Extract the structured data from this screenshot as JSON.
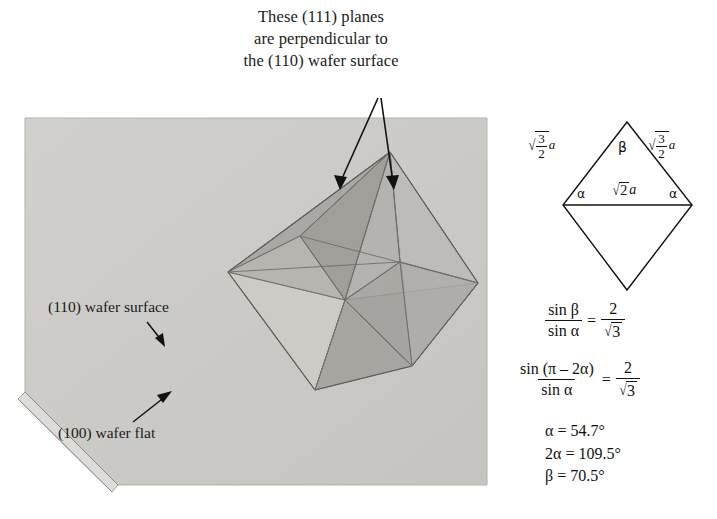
{
  "figure": {
    "kind": "crystallography-diagram",
    "caption_lines": [
      "These (111) planes",
      "are perpendicular to",
      "the (110) wafer surface"
    ],
    "caption_full": "These (111) planes are perpendicular to the (110) wafer surface"
  },
  "wafer": {
    "surface_label": "(110) wafer surface",
    "flat_label": "(100) wafer flat",
    "slab_fill": "#cccac6",
    "bevel_fill": "#dedcd8",
    "edge_stroke": "#8d8a86"
  },
  "octahedron": {
    "name": "octahedron-111-planes",
    "face_light": "#c3c1bd",
    "face_mid": "#adaba7",
    "face_dark": "#9d9b97",
    "edge_stroke": "#6f6d6a"
  },
  "arrows": {
    "count": 2,
    "color": "#111111",
    "targets": [
      "left-111-plane",
      "right-111-plane"
    ]
  },
  "rhombus": {
    "name": "rhombus-geometry",
    "stroke": "#111111",
    "edge_label_left": {
      "radical_num": "3",
      "radical_den": "2",
      "var": "a"
    },
    "edge_label_right": {
      "radical_num": "3",
      "radical_den": "2",
      "var": "a"
    },
    "diagonal_label": {
      "radical": "2",
      "var": "a"
    },
    "angle_top": "β",
    "angle_left": "α",
    "angle_right": "α"
  },
  "equations": {
    "eq1": {
      "num": "sin β",
      "den": "sin α",
      "equals": "=",
      "rhs_num": "2",
      "rhs_den_radical": "3"
    },
    "eq2": {
      "num": "sin (π – 2α)",
      "den": "sin α",
      "equals": "=",
      "rhs_num": "2",
      "rhs_den_radical": "3"
    }
  },
  "values": [
    "α = 54.7°",
    "2α = 109.5°",
    "β = 70.5°"
  ]
}
